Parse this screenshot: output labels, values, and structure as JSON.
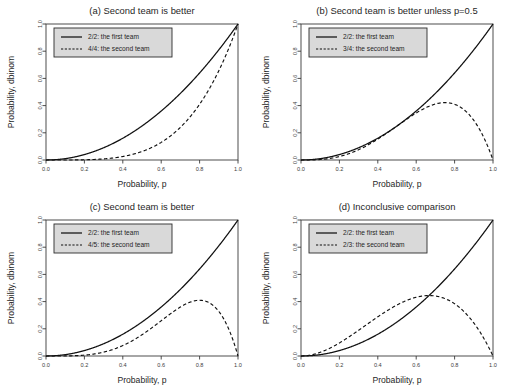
{
  "figure": {
    "title": "",
    "background": "#ffffff",
    "panel_count": 4
  },
  "chart_data": [
    {
      "type": "line",
      "panel": "a",
      "title": "(a) Second team is better",
      "xlabel": "Probability, p",
      "ylabel": "Probability, dbinom",
      "xlim": [
        0,
        1
      ],
      "ylim": [
        0,
        1
      ],
      "xticks": [
        "0.0",
        "0.2",
        "0.4",
        "0.6",
        "0.8",
        "1.0"
      ],
      "xtickvals": [
        0,
        0.2,
        0.4,
        0.6,
        0.8,
        1
      ],
      "yticks": [
        "0.0",
        "0.2",
        "0.4",
        "0.6",
        "0.8",
        "1.0"
      ],
      "ytickvals": [
        0,
        0.2,
        0.4,
        0.6,
        0.8,
        1
      ],
      "grid": false,
      "legend_position": "top-left",
      "series": [
        {
          "name": "2/2: the first team",
          "style": "solid",
          "binom": {
            "n": 2,
            "k": 2
          },
          "x": [
            0,
            0.05,
            0.1,
            0.15,
            0.2,
            0.25,
            0.3,
            0.35,
            0.4,
            0.45,
            0.5,
            0.55,
            0.6,
            0.65,
            0.7,
            0.75,
            0.8,
            0.85,
            0.9,
            0.95,
            1
          ],
          "values": [
            0,
            0.0025,
            0.01,
            0.0225,
            0.04,
            0.0625,
            0.09,
            0.1225,
            0.16,
            0.2025,
            0.25,
            0.3025,
            0.36,
            0.4225,
            0.49,
            0.5625,
            0.64,
            0.7225,
            0.81,
            0.9025,
            1
          ]
        },
        {
          "name": "4/4: the second team",
          "style": "dashed",
          "binom": {
            "n": 4,
            "k": 4
          },
          "x": [
            0,
            0.05,
            0.1,
            0.15,
            0.2,
            0.25,
            0.3,
            0.35,
            0.4,
            0.45,
            0.5,
            0.55,
            0.6,
            0.65,
            0.7,
            0.75,
            0.8,
            0.85,
            0.9,
            0.95,
            1
          ],
          "values": [
            0,
            6.25e-06,
            0.0001,
            0.00050625,
            0.0016,
            0.00390625,
            0.0081,
            0.01500625,
            0.0256,
            0.04100625,
            0.0625,
            0.09150625,
            0.1296,
            0.17850625,
            0.2401,
            0.31640625,
            0.4096,
            0.52200625,
            0.6561,
            0.81450625,
            1
          ]
        }
      ]
    },
    {
      "type": "line",
      "panel": "b",
      "title": "(b) Second team is better unless p=0.5",
      "xlabel": "Probability, p",
      "ylabel": "Probability, dbinom",
      "xlim": [
        0,
        1
      ],
      "ylim": [
        0,
        1
      ],
      "xticks": [
        "0.0",
        "0.2",
        "0.4",
        "0.6",
        "0.8",
        "1.0"
      ],
      "xtickvals": [
        0,
        0.2,
        0.4,
        0.6,
        0.8,
        1
      ],
      "yticks": [
        "0.0",
        "0.2",
        "0.4",
        "0.6",
        "0.8",
        "1.0"
      ],
      "ytickvals": [
        0,
        0.2,
        0.4,
        0.6,
        0.8,
        1
      ],
      "grid": false,
      "legend_position": "top-left",
      "series": [
        {
          "name": "2/2: the first team",
          "style": "solid",
          "binom": {
            "n": 2,
            "k": 2
          },
          "x": [
            0,
            0.05,
            0.1,
            0.15,
            0.2,
            0.25,
            0.3,
            0.35,
            0.4,
            0.45,
            0.5,
            0.55,
            0.6,
            0.65,
            0.7,
            0.75,
            0.8,
            0.85,
            0.9,
            0.95,
            1
          ],
          "values": [
            0,
            0.0025,
            0.01,
            0.0225,
            0.04,
            0.0625,
            0.09,
            0.1225,
            0.16,
            0.2025,
            0.25,
            0.3025,
            0.36,
            0.4225,
            0.49,
            0.5625,
            0.64,
            0.7225,
            0.81,
            0.9025,
            1
          ]
        },
        {
          "name": "3/4: the second team",
          "style": "dashed",
          "binom": {
            "n": 4,
            "k": 3
          },
          "x": [
            0,
            0.05,
            0.1,
            0.15,
            0.2,
            0.25,
            0.3,
            0.35,
            0.4,
            0.45,
            0.5,
            0.55,
            0.6,
            0.65,
            0.7,
            0.75,
            0.8,
            0.85,
            0.9,
            0.95,
            1
          ],
          "values": [
            0,
            0.000475,
            0.0036,
            0.01147,
            0.0256,
            0.046875,
            0.0756,
            0.11147,
            0.1536,
            0.200475,
            0.25,
            0.299475,
            0.3456,
            0.384475,
            0.4116,
            0.421875,
            0.4096,
            0.368475,
            0.2916,
            0.171475,
            0
          ]
        }
      ]
    },
    {
      "type": "line",
      "panel": "c",
      "title": "(c) Second team is better",
      "xlabel": "Probability, p",
      "ylabel": "Probability, dbinom",
      "xlim": [
        0,
        1
      ],
      "ylim": [
        0,
        1
      ],
      "xticks": [
        "0.0",
        "0.2",
        "0.4",
        "0.6",
        "0.8",
        "1.0"
      ],
      "xtickvals": [
        0,
        0.2,
        0.4,
        0.6,
        0.8,
        1
      ],
      "yticks": [
        "0.0",
        "0.2",
        "0.4",
        "0.6",
        "0.8",
        "1.0"
      ],
      "ytickvals": [
        0,
        0.2,
        0.4,
        0.6,
        0.8,
        1
      ],
      "grid": false,
      "legend_position": "top-left",
      "series": [
        {
          "name": "2/2: the first team",
          "style": "solid",
          "binom": {
            "n": 2,
            "k": 2
          },
          "x": [
            0,
            0.05,
            0.1,
            0.15,
            0.2,
            0.25,
            0.3,
            0.35,
            0.4,
            0.45,
            0.5,
            0.55,
            0.6,
            0.65,
            0.7,
            0.75,
            0.8,
            0.85,
            0.9,
            0.95,
            1
          ],
          "values": [
            0,
            0.0025,
            0.01,
            0.0225,
            0.04,
            0.0625,
            0.09,
            0.1225,
            0.16,
            0.2025,
            0.25,
            0.3025,
            0.36,
            0.4225,
            0.49,
            0.5625,
            0.64,
            0.7225,
            0.81,
            0.9025,
            1
          ]
        },
        {
          "name": "4/5: the second team",
          "style": "dashed",
          "binom": {
            "n": 5,
            "k": 4
          },
          "x": [
            0,
            0.05,
            0.1,
            0.15,
            0.2,
            0.25,
            0.3,
            0.35,
            0.4,
            0.45,
            0.5,
            0.55,
            0.6,
            0.65,
            0.7,
            0.75,
            0.8,
            0.85,
            0.9,
            0.95,
            1
          ],
          "values": [
            0,
            2.97e-05,
            0.00045,
            0.00215,
            0.0064,
            0.01465,
            0.02835,
            0.04875,
            0.0768,
            0.11264,
            0.15625,
            0.20589,
            0.2592,
            0.31239,
            0.36015,
            0.39551,
            0.4096,
            0.39164,
            0.32805,
            0.20363,
            0
          ]
        }
      ]
    },
    {
      "type": "line",
      "panel": "d",
      "title": "(d) Inconclusive comparison",
      "xlabel": "Probability, p",
      "ylabel": "Probability, dbinom",
      "xlim": [
        0,
        1
      ],
      "ylim": [
        0,
        1
      ],
      "xticks": [
        "0.0",
        "0.2",
        "0.4",
        "0.6",
        "0.8",
        "1.0"
      ],
      "xtickvals": [
        0,
        0.2,
        0.4,
        0.6,
        0.8,
        1
      ],
      "yticks": [
        "0.0",
        "0.2",
        "0.4",
        "0.6",
        "0.8",
        "1.0"
      ],
      "ytickvals": [
        0,
        0.2,
        0.4,
        0.6,
        0.8,
        1
      ],
      "grid": false,
      "legend_position": "top-left",
      "series": [
        {
          "name": "2/2: the first team",
          "style": "solid",
          "binom": {
            "n": 2,
            "k": 2
          },
          "x": [
            0,
            0.05,
            0.1,
            0.15,
            0.2,
            0.25,
            0.3,
            0.35,
            0.4,
            0.45,
            0.5,
            0.55,
            0.6,
            0.65,
            0.7,
            0.75,
            0.8,
            0.85,
            0.9,
            0.95,
            1
          ],
          "values": [
            0,
            0.0025,
            0.01,
            0.0225,
            0.04,
            0.0625,
            0.09,
            0.1225,
            0.16,
            0.2025,
            0.25,
            0.3025,
            0.36,
            0.4225,
            0.49,
            0.5625,
            0.64,
            0.7225,
            0.81,
            0.9025,
            1
          ]
        },
        {
          "name": "2/3: the second team",
          "style": "dashed",
          "binom": {
            "n": 3,
            "k": 2
          },
          "x": [
            0,
            0.05,
            0.1,
            0.15,
            0.2,
            0.25,
            0.3,
            0.35,
            0.4,
            0.45,
            0.5,
            0.55,
            0.6,
            0.65,
            0.7,
            0.75,
            0.8,
            0.85,
            0.9,
            0.95,
            1
          ],
          "values": [
            0,
            0.007125,
            0.027,
            0.057375,
            0.096,
            0.140625,
            0.189,
            0.239,
            0.288,
            0.334125,
            0.375,
            0.408375,
            0.432,
            0.443625,
            0.441,
            0.421875,
            0.384,
            0.325125,
            0.243,
            0.135375,
            0
          ]
        }
      ]
    }
  ],
  "colors": {
    "line": "#111111",
    "axis": "#3a3a3a",
    "legend_fill": "#d9d9d9",
    "legend_border": "#2b2b2b",
    "background": "#ffffff",
    "text": "#1f1f1f"
  }
}
